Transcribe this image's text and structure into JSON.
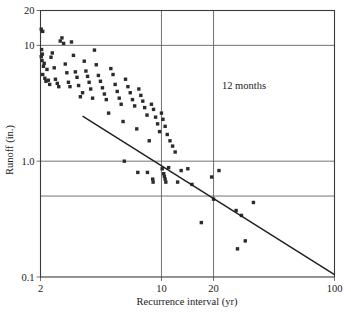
{
  "chart_data": {
    "type": "scatter",
    "title": "",
    "xlabel": "Recurrence interval (yr)",
    "ylabel": "Runoff (in.)",
    "xscale": "log",
    "yscale": "log",
    "xlim": [
      2,
      100
    ],
    "ylim": [
      0.1,
      20
    ],
    "xticks": [
      2,
      10,
      20,
      100
    ],
    "xticklabels": [
      "2",
      "10",
      "20",
      "100"
    ],
    "yticks": [
      0.1,
      1.0,
      10,
      20
    ],
    "yticklabels": [
      "0.1",
      "1.0",
      "10",
      "20"
    ],
    "grid": true,
    "gridlines_x": [
      10,
      20
    ],
    "gridlines_y": [
      0.5,
      1.0,
      10
    ],
    "annotations": [
      {
        "text": "12 months",
        "x": 30,
        "y": 4.2
      }
    ],
    "legend": null,
    "series": [
      {
        "name": "Runoff vs recurrence interval",
        "marker": "square",
        "points": [
          [
            2.02,
            13.8
          ],
          [
            2.06,
            13.2
          ],
          [
            2.03,
            9.2
          ],
          [
            2.05,
            8.4
          ],
          [
            2.02,
            8.0
          ],
          [
            2.04,
            7.4
          ],
          [
            2.08,
            6.6
          ],
          [
            2.1,
            7.0
          ],
          [
            2.06,
            5.6
          ],
          [
            2.12,
            5.2
          ],
          [
            2.15,
            4.9
          ],
          [
            2.18,
            6.2
          ],
          [
            2.22,
            5.0
          ],
          [
            2.26,
            4.6
          ],
          [
            2.3,
            7.9
          ],
          [
            2.34,
            8.6
          ],
          [
            2.4,
            6.4
          ],
          [
            2.44,
            5.1
          ],
          [
            2.5,
            4.7
          ],
          [
            2.55,
            4.4
          ],
          [
            2.6,
            10.9
          ],
          [
            2.66,
            11.6
          ],
          [
            2.72,
            10.4
          ],
          [
            2.78,
            6.9
          ],
          [
            2.84,
            5.8
          ],
          [
            2.9,
            4.8
          ],
          [
            2.96,
            4.4
          ],
          [
            3.02,
            10.7
          ],
          [
            3.1,
            8.2
          ],
          [
            3.18,
            5.9
          ],
          [
            3.25,
            5.3
          ],
          [
            3.32,
            4.5
          ],
          [
            3.4,
            3.6
          ],
          [
            3.5,
            3.9
          ],
          [
            3.58,
            7.3
          ],
          [
            3.66,
            6.0
          ],
          [
            3.74,
            5.4
          ],
          [
            3.82,
            4.8
          ],
          [
            3.9,
            4.2
          ],
          [
            4.0,
            3.5
          ],
          [
            4.1,
            9.1
          ],
          [
            4.2,
            6.8
          ],
          [
            4.32,
            5.5
          ],
          [
            4.44,
            4.9
          ],
          [
            4.56,
            4.3
          ],
          [
            4.68,
            3.8
          ],
          [
            4.8,
            3.4
          ],
          [
            4.95,
            2.6
          ],
          [
            5.1,
            6.3
          ],
          [
            5.25,
            5.6
          ],
          [
            5.4,
            4.6
          ],
          [
            5.55,
            4.0
          ],
          [
            5.7,
            3.5
          ],
          [
            5.85,
            3.1
          ],
          [
            6.0,
            2.2
          ],
          [
            6.2,
            5.1
          ],
          [
            6.4,
            4.4
          ],
          [
            6.6,
            3.9
          ],
          [
            6.8,
            3.4
          ],
          [
            7.0,
            3.0
          ],
          [
            7.2,
            1.9
          ],
          [
            7.4,
            4.2
          ],
          [
            7.6,
            3.7
          ],
          [
            7.8,
            3.3
          ],
          [
            8.0,
            2.9
          ],
          [
            8.25,
            2.5
          ],
          [
            8.5,
            1.5
          ],
          [
            8.75,
            3.1
          ],
          [
            9.0,
            2.8
          ],
          [
            9.25,
            2.4
          ],
          [
            9.5,
            2.1
          ],
          [
            9.75,
            1.8
          ],
          [
            10.0,
            2.6
          ],
          [
            10.2,
            2.3
          ],
          [
            10.5,
            2.0
          ],
          [
            10.8,
            1.7
          ],
          [
            11.2,
            1.5
          ],
          [
            11.6,
            1.35
          ],
          [
            12.0,
            1.2
          ],
          [
            6.1,
            1.0
          ],
          [
            7.3,
            0.8
          ],
          [
            8.3,
            0.8
          ],
          [
            8.9,
            0.7
          ],
          [
            8.95,
            0.66
          ],
          [
            10.1,
            0.86
          ],
          [
            10.3,
            0.78
          ],
          [
            10.4,
            0.74
          ],
          [
            10.5,
            0.7
          ],
          [
            10.6,
            0.66
          ],
          [
            11.0,
            0.88
          ],
          [
            12.4,
            0.66
          ],
          [
            13.0,
            0.83
          ],
          [
            14.2,
            0.86
          ],
          [
            15.0,
            0.63
          ],
          [
            17.0,
            0.295
          ],
          [
            19.5,
            0.73
          ],
          [
            20.0,
            0.47
          ],
          [
            21.5,
            0.83
          ],
          [
            27.0,
            0.375
          ],
          [
            29.0,
            0.34
          ],
          [
            30.5,
            0.205
          ],
          [
            27.5,
            0.175
          ],
          [
            34.0,
            0.44
          ]
        ]
      }
    ],
    "fit_line": {
      "type": "line",
      "x_start": 3.5,
      "y_start": 2.45,
      "x_end": 100,
      "y_end": 0.105
    }
  },
  "axes": {
    "x_title": "Recurrence interval (yr)",
    "y_title": "Runoff (in.)",
    "x_tick_labels": [
      "2",
      "10",
      "20",
      "100"
    ],
    "y_tick_labels": [
      "20",
      "10",
      "1.0",
      "0.1"
    ]
  },
  "annotation": {
    "label": "12 months"
  },
  "colors": {
    "marker": "#2b2b2b",
    "line": "#1e1e1e",
    "grid": "#5a5a5a",
    "frame": "#3a3a3a",
    "background": "#ffffff"
  }
}
